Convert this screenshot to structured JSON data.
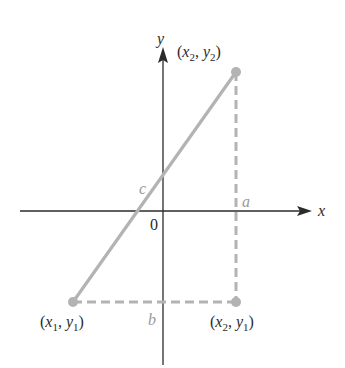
{
  "diagram": {
    "type": "distance-formula",
    "axes": {
      "x_label": "x",
      "y_label": "y",
      "origin_label": "0"
    },
    "points": {
      "p1": {
        "label_x": "x",
        "label_x_sub": "1",
        "label_y": "y",
        "label_y_sub": "1"
      },
      "p2": {
        "label_x": "x",
        "label_x_sub": "2",
        "label_y": "y",
        "label_y_sub": "2"
      },
      "p3": {
        "label_x": "x",
        "label_x_sub": "2",
        "label_y": "y",
        "label_y_sub": "1"
      }
    },
    "sides": {
      "hypotenuse": "c",
      "vertical": "a",
      "horizontal": "b"
    },
    "colors": {
      "axis": "#2b2b2b",
      "segment": "#b3b3b3",
      "label": "#2b2b2b",
      "side_label": "#9a9a9a"
    }
  }
}
